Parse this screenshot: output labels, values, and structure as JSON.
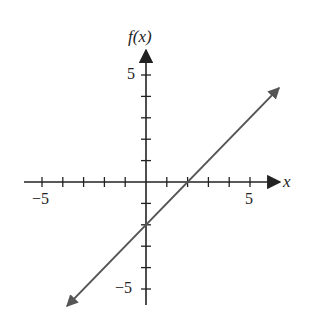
{
  "chart_data": {
    "type": "line",
    "title": "",
    "xlabel": "x",
    "ylabel": "f(x)",
    "xlim": [
      -6,
      6
    ],
    "ylim": [
      -6,
      6
    ],
    "x_ticks": [
      -5,
      -4,
      -3,
      -2,
      -1,
      1,
      2,
      3,
      4,
      5
    ],
    "y_ticks": [
      -5,
      -4,
      -3,
      -2,
      -1,
      1,
      2,
      3,
      4,
      5
    ],
    "x_tick_labels": [
      {
        "value": -5,
        "label": "−5"
      },
      {
        "value": 5,
        "label": "5"
      }
    ],
    "y_tick_labels": [
      {
        "value": 5,
        "label": "5"
      },
      {
        "value": -5,
        "label": "−5"
      }
    ],
    "grid": false,
    "legend": null,
    "series": [
      {
        "name": "f(x) = x − 2",
        "equation": "f(x) = x - 2",
        "slope": 1,
        "intercept": -2,
        "x": [
          -3.8,
          6.4
        ],
        "y": [
          -5.8,
          4.4
        ],
        "x_intercept": 2,
        "y_intercept": -2,
        "arrows_both_ends": true,
        "color": "#555555"
      }
    ]
  },
  "labels": {
    "x_axis": "x",
    "y_axis": "f(x)",
    "x_neg5": "−5",
    "x_pos5": "5",
    "y_pos5": "5",
    "y_neg5": "−5"
  },
  "colors": {
    "axis": "#222222",
    "line": "#555555",
    "background": "#ffffff"
  }
}
